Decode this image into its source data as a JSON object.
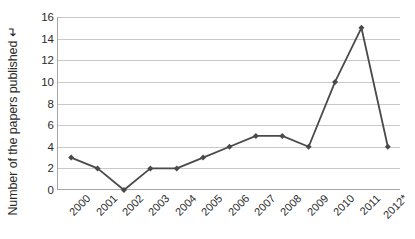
{
  "chart_data": {
    "type": "line",
    "title": "",
    "subtitle": "",
    "xlabel": "",
    "ylabel": "Number of the papers published ↵",
    "categories": [
      "2000",
      "2001",
      "2002",
      "2003",
      "2004",
      "2005",
      "2006",
      "2007",
      "2008",
      "2009",
      "2010",
      "2011",
      "2012*"
    ],
    "values": [
      3,
      2,
      0,
      2,
      2,
      3,
      4,
      5,
      5,
      4,
      10,
      15,
      4
    ],
    "series": [
      {
        "name": "Number of the papers published",
        "values": [
          3,
          2,
          0,
          2,
          2,
          3,
          4,
          5,
          5,
          4,
          10,
          15,
          4
        ]
      }
    ],
    "ylim": [
      0,
      16
    ],
    "yticks": [
      0,
      2,
      4,
      6,
      8,
      10,
      12,
      14,
      16
    ],
    "ytick_labels": [
      "0",
      "2",
      "4",
      "6",
      "8",
      "10",
      "12",
      "14",
      "16"
    ],
    "grid": "horizontal",
    "legend": "none",
    "legend_position": "none",
    "marker": "diamond",
    "line_color": "#4a4a4a",
    "marker_color": "#4a4a4a",
    "grid_color": "#c9c9c9",
    "axis_color": "#a6a6a6",
    "text_color": "#2b2b2b",
    "background_color": "#ffffff",
    "annotations": [
      "* on 2012 category label"
    ]
  }
}
